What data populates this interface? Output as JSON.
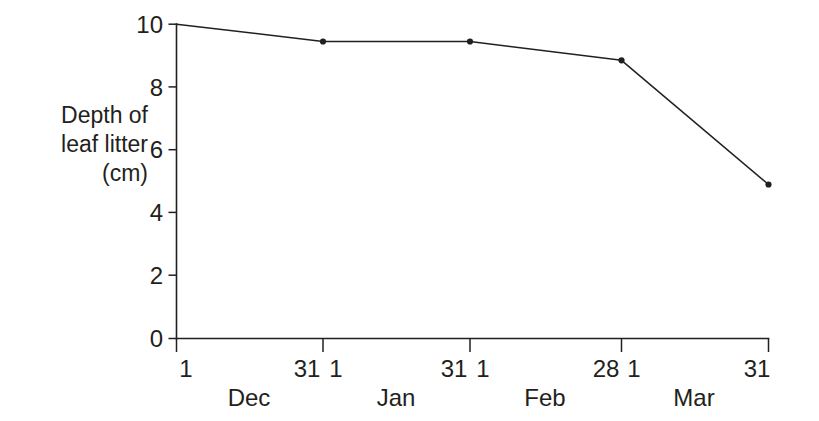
{
  "chart_data": {
    "type": "line",
    "title": "",
    "xlabel": "",
    "ylabel": "Depth of leaf litter (cm)",
    "ylabel_lines": [
      "Depth of",
      "leaf litter",
      "(cm)"
    ],
    "ylim": [
      0,
      10
    ],
    "y_ticks": [
      "0",
      "2",
      "4",
      "6",
      "8",
      "10"
    ],
    "y_tick_values": [
      0,
      2,
      4,
      6,
      8,
      10
    ],
    "grid": false,
    "legend": "none",
    "x_axis": {
      "day_labels": [
        "1",
        "31",
        "1",
        "31",
        "1",
        "28",
        "1",
        "31"
      ],
      "month_labels": [
        "Dec",
        "Jan",
        "Feb",
        "Mar"
      ],
      "tick_labels": [
        "1 Dec",
        "31 Dec / 1 Jan",
        "31 Jan / 1 Feb",
        "28 Feb / 1 Mar",
        "31 Mar"
      ]
    },
    "x": [
      "1 Dec",
      "31 Dec",
      "31 Jan",
      "28 Feb",
      "31 Mar"
    ],
    "values": [
      10.0,
      9.45,
      9.45,
      8.85,
      4.9
    ],
    "series": [
      {
        "name": "Depth of leaf litter",
        "points": [
          {
            "x": "1 Dec",
            "y": 10.0,
            "marker": false
          },
          {
            "x": "31 Dec",
            "y": 9.45,
            "marker": true
          },
          {
            "x": "31 Jan",
            "y": 9.45,
            "marker": true
          },
          {
            "x": "28 Feb",
            "y": 8.85,
            "marker": true
          },
          {
            "x": "31 Mar",
            "y": 4.9,
            "marker": true
          }
        ]
      }
    ],
    "colors": {
      "line": "#231f20",
      "marker": "#231f20",
      "axis": "#231f20",
      "background": "#ffffff"
    }
  }
}
